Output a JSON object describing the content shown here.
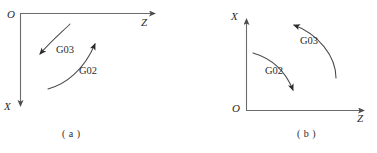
{
  "figure": {
    "stroke_color": "#4d4d4d",
    "text_color": "#2a2a2a",
    "background_color": "#ffffff",
    "panels": [
      {
        "caption": "( a )",
        "origin_label": "O",
        "vertical_axis_label": "X",
        "vertical_axis_direction": "down",
        "horizontal_axis_label": "Z",
        "horizontal_axis_direction": "right",
        "arcs": [
          {
            "label": "G03",
            "direction": "counter-clockwise",
            "arrow_end": "lower-left"
          },
          {
            "label": "G02",
            "direction": "clockwise",
            "arrow_end": "upper-right"
          }
        ]
      },
      {
        "caption": "( b )",
        "origin_label": "O",
        "vertical_axis_label": "X",
        "vertical_axis_direction": "up",
        "horizontal_axis_label": "Z",
        "horizontal_axis_direction": "right",
        "arcs": [
          {
            "label": "G03",
            "direction": "counter-clockwise",
            "arrow_end": "upper-left"
          },
          {
            "label": "G02",
            "direction": "clockwise",
            "arrow_end": "lower-right"
          }
        ]
      }
    ]
  }
}
